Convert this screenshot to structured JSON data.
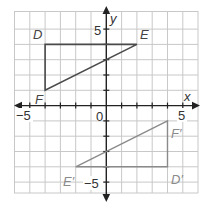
{
  "diagram": {
    "type": "coordinate-plane",
    "axes": {
      "x_label": "x",
      "y_label": "y",
      "x_ticks_labeled": [
        "-5",
        "0",
        "5"
      ],
      "y_ticks_labeled": [
        "5",
        "-5"
      ]
    },
    "origin_label": "0",
    "colors": {
      "original": "#4a4a4a",
      "image": "#8a8a8a",
      "grid": "#c8c8c8"
    },
    "original_triangle": {
      "vertices": [
        {
          "name": "D",
          "x": -4,
          "y": 4
        },
        {
          "name": "E",
          "x": 2,
          "y": 4
        },
        {
          "name": "F",
          "x": -4,
          "y": 1
        }
      ]
    },
    "image_triangle": {
      "vertices": [
        {
          "name": "D′",
          "x": 4,
          "y": -4
        },
        {
          "name": "E′",
          "x": -2,
          "y": -4
        },
        {
          "name": "F′",
          "x": 4,
          "y": -1
        }
      ]
    }
  },
  "labels": {
    "x": "x",
    "y": "y",
    "xm5": "−5",
    "x0": "0",
    "x5": "5",
    "y5": "5",
    "ym5": "−5",
    "D": "D",
    "E": "E",
    "F": "F",
    "Dp": "D′",
    "Ep": "E′",
    "Fp": "F′"
  }
}
